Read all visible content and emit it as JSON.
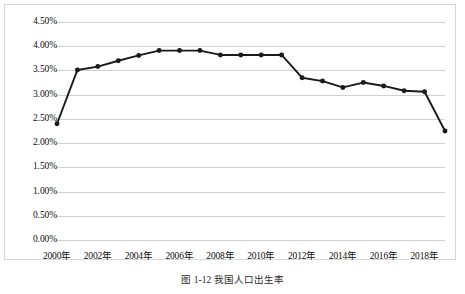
{
  "figure": {
    "caption": "图 1-12  我国人口出生率",
    "frame_color": "#d8d8d8",
    "grid_color": "#d0d0d0",
    "line_color": "#1a1a1a"
  },
  "chart_data": {
    "type": "line",
    "title": "",
    "xlabel": "",
    "ylabel": "",
    "grid": true,
    "legend": "none",
    "ylim": [
      0,
      4.5
    ],
    "ytick_labels": [
      "4.50%",
      "4.00%",
      "3.50%",
      "3.00%",
      "2.50%",
      "2.00%",
      "1.50%",
      "1.00%",
      "0.50%",
      "0.00%"
    ],
    "ytick_values": [
      4.5,
      4.0,
      3.5,
      3.0,
      2.5,
      2.0,
      1.5,
      1.0,
      0.5,
      0.0
    ],
    "xtick_labels": [
      "2000年",
      "2002年",
      "2004年",
      "2006年",
      "2008年",
      "2010年",
      "2012年",
      "2014年",
      "2016年",
      "2018年"
    ],
    "xtick_values": [
      2000,
      2002,
      2004,
      2006,
      2008,
      2010,
      2012,
      2014,
      2016,
      2018
    ],
    "xlim": [
      2000,
      2019
    ],
    "categories": [
      2000,
      2001,
      2002,
      2003,
      2004,
      2005,
      2006,
      2007,
      2008,
      2009,
      2010,
      2011,
      2012,
      2013,
      2014,
      2015,
      2016,
      2017,
      2018,
      2019
    ],
    "values": [
      2.4,
      3.51,
      3.58,
      3.7,
      3.81,
      3.91,
      3.91,
      3.91,
      3.82,
      3.82,
      3.82,
      3.82,
      3.35,
      3.28,
      3.15,
      3.25,
      3.18,
      3.08,
      3.06,
      2.25
    ],
    "marker": "circle",
    "marker_size": 4
  }
}
